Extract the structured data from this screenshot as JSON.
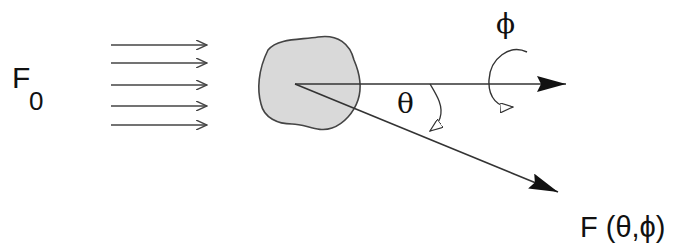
{
  "diagram": {
    "labels": {
      "incident_flux": "F",
      "incident_flux_subscript": "0",
      "polar_angle": "θ",
      "azimuth_angle": "ϕ",
      "scattered_flux": "F (θ,ϕ)"
    },
    "elements": {
      "incident_rays_count": 5,
      "scatterer": "irregular particle",
      "forward_axis": "incident direction",
      "scattered_ray": "scattered direction"
    },
    "colors": {
      "line": "#333333",
      "particle_fill": "#d9d9d9",
      "particle_stroke": "#444444",
      "background": "#ffffff"
    }
  }
}
